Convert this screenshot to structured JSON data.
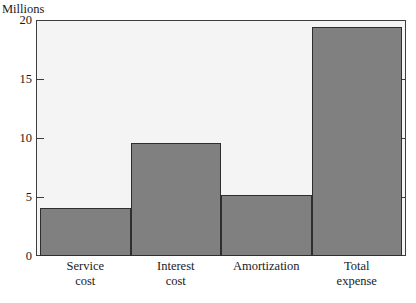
{
  "chart_data": {
    "type": "bar",
    "title": "",
    "xlabel": "",
    "ylabel": "Millions",
    "categories": [
      "Service cost",
      "Interest cost",
      "Amortization",
      "Total expense"
    ],
    "category_lines": [
      [
        "Service",
        "cost"
      ],
      [
        "Interest",
        "cost"
      ],
      [
        "Amortization",
        ""
      ],
      [
        "Total",
        "expense"
      ]
    ],
    "values": [
      4.1,
      9.6,
      5.2,
      19.4
    ],
    "ylim": [
      0,
      20
    ],
    "yticks": [
      0,
      5,
      10,
      15,
      20
    ],
    "ytick_labels": [
      "0",
      "5",
      "10",
      "15",
      "20"
    ],
    "grid": false,
    "legend": "none",
    "bar_color": "#808080",
    "bar_edge_color": "#2e2e2e",
    "plot_background": "#f4f4f4",
    "axis_color": "#3d3d3d"
  },
  "axis": {
    "units_caption": "Millions"
  }
}
